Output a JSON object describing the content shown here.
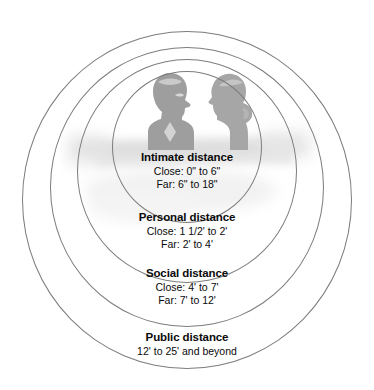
{
  "diagram": {
    "name": "proxemics-zones-diagram",
    "type": "concentric-circles",
    "background_color": "#ffffff",
    "ring_color": "#7c7c7c",
    "text_color": "#0a0a0a",
    "silhouette_color": "#9e9e9e",
    "illustration": {
      "description": "two facing head-and-shoulders silhouettes",
      "left_figure": "man-silhouette",
      "right_figure": "woman-silhouette"
    }
  },
  "zones": [
    {
      "id": "intimate",
      "title": "Intimate distance",
      "close": "Close: 0\" to 6\"",
      "far": "Far: 6\" to 18\""
    },
    {
      "id": "personal",
      "title": "Personal distance",
      "close": "Close: 1 1/2' to 2'",
      "far": "Far: 2' to 4'"
    },
    {
      "id": "social",
      "title": "Social distance",
      "close": "Close: 4' to 7'",
      "far": "Far: 7' to 12'"
    },
    {
      "id": "public",
      "title": "Public distance",
      "close": "12' to 25' and beyond",
      "far": ""
    }
  ]
}
